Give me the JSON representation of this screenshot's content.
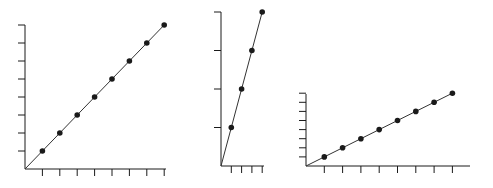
{
  "figure": {
    "background": "#ffffff",
    "ink": "#1a1a1a",
    "line_color": "#333333"
  },
  "chart_data": [
    {
      "type": "line",
      "title": "",
      "xlabel": "",
      "ylabel": "",
      "x": [
        0,
        1,
        2,
        3,
        4,
        5,
        6,
        7,
        8
      ],
      "values": [
        0,
        1,
        2,
        3,
        4,
        5,
        6,
        7,
        8
      ],
      "marked_points": [
        [
          1,
          1
        ],
        [
          2,
          2
        ],
        [
          3,
          3
        ],
        [
          4,
          4
        ],
        [
          5,
          5
        ],
        [
          6,
          6
        ],
        [
          7,
          7
        ],
        [
          8,
          8
        ]
      ],
      "xlim": [
        0,
        8
      ],
      "ylim": [
        0,
        8
      ],
      "x_ticks": 8,
      "y_ticks": 8,
      "grid": false,
      "legend": null,
      "layout": {
        "origin": [
          25,
          169
        ],
        "px_per_x": 17.4,
        "px_per_y": 18.0,
        "x_axis_end": 166,
        "y_axis_top": 25
      }
    },
    {
      "type": "line",
      "title": "",
      "xlabel": "",
      "ylabel": "",
      "x": [
        0,
        1,
        2,
        3,
        4
      ],
      "values": [
        0,
        1,
        2,
        3,
        4
      ],
      "marked_points": [
        [
          1,
          1
        ],
        [
          2,
          2
        ],
        [
          3,
          3
        ],
        [
          4,
          4
        ]
      ],
      "xlim": [
        0,
        4
      ],
      "ylim": [
        0,
        4
      ],
      "x_ticks": 4,
      "y_ticks": 4,
      "grid": false,
      "legend": null,
      "layout": {
        "origin": [
          221,
          166
        ],
        "px_per_x": 10.3,
        "px_per_y": 38.5,
        "x_axis_end": 264,
        "y_axis_top": 12
      }
    },
    {
      "type": "line",
      "title": "",
      "xlabel": "",
      "ylabel": "",
      "x": [
        0,
        1,
        2,
        3,
        4,
        5,
        6,
        7,
        8
      ],
      "values": [
        0,
        1,
        2,
        3,
        4,
        5,
        6,
        7,
        8
      ],
      "marked_points": [
        [
          1,
          1
        ],
        [
          2,
          2
        ],
        [
          3,
          3
        ],
        [
          4,
          4
        ],
        [
          5,
          5
        ],
        [
          6,
          6
        ],
        [
          7,
          7
        ],
        [
          8,
          8
        ]
      ],
      "xlim": [
        0,
        9
      ],
      "ylim": [
        0,
        8
      ],
      "x_ticks": 8,
      "y_ticks": 8,
      "grid": false,
      "legend": null,
      "layout": {
        "origin": [
          306,
          166
        ],
        "px_per_x": 18.3,
        "px_per_y": 9.1,
        "x_axis_end": 470,
        "y_axis_top": 94
      }
    }
  ]
}
